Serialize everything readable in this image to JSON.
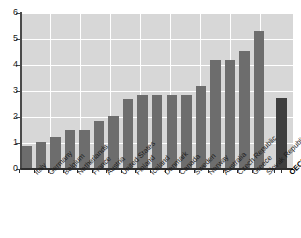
{
  "chart_data": {
    "type": "bar",
    "title": "",
    "subtitle": "",
    "xlabel": "",
    "ylabel": "",
    "ylim": [
      0,
      6
    ],
    "ytick_labels": [
      "0",
      "1",
      "2",
      "3",
      "4",
      "5",
      "6"
    ],
    "ytick_values": [
      0,
      1,
      2,
      3,
      4,
      5,
      6
    ],
    "grid": true,
    "legend": "none",
    "categories": [
      "Italy",
      "Germany",
      "Belgium",
      "Netherlands",
      "France",
      "Austria",
      "United States",
      "Finland",
      "Iceland",
      "Denmark",
      "Canada",
      "Sweden",
      "Norway",
      "Australia",
      "Czech Republic",
      "Greece",
      "Slovak Republic",
      "OECD17"
    ],
    "values": [
      0.9,
      1.05,
      1.25,
      1.5,
      1.5,
      1.85,
      2.05,
      2.7,
      2.85,
      2.85,
      2.85,
      2.85,
      3.2,
      4.2,
      4.2,
      4.55,
      5.3,
      2.75
    ],
    "highlight_category": "OECD17",
    "bar_color": "#6d6d6d",
    "highlight_color": "#3f3f3f",
    "plot_background": "#d7d7d7",
    "gridline_color": "#ffffff",
    "axis_color": "#2f2f2f",
    "separator_before_last": true
  }
}
